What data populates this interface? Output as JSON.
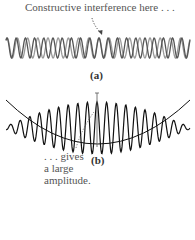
{
  "figure": {
    "top_caption": "Constructive interference here . . .",
    "panel_a_label": "(a)",
    "panel_b_label": "(b)",
    "note_lines": [
      ". . . gives",
      "a large",
      "amplitude."
    ]
  },
  "colors": {
    "wave_dark": "#555555",
    "wave_light": "#9a9a9a",
    "beat_wave": "#111111",
    "text": "#555555"
  }
}
